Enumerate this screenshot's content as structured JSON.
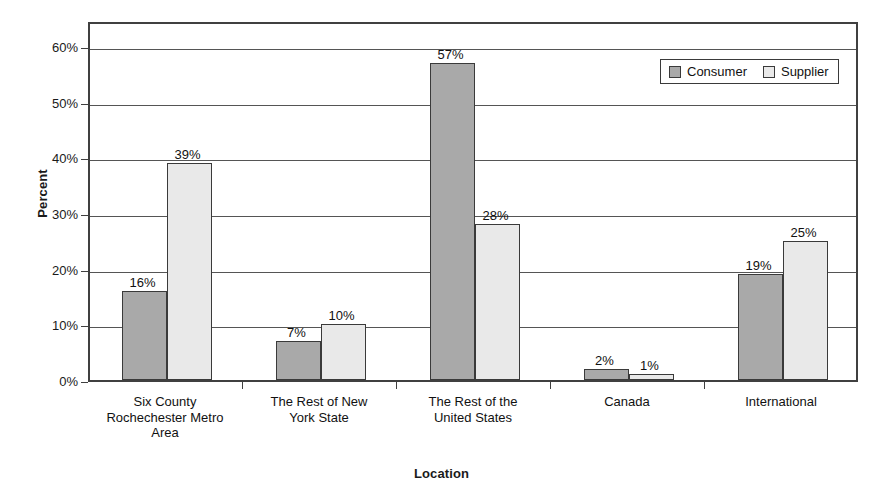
{
  "chart_data": {
    "type": "bar",
    "title": "",
    "xlabel": "Location",
    "ylabel": "Percent",
    "categories": [
      "Six County\nRochechester Metro\nArea",
      "The Rest of New\nYork State",
      "The Rest of the\nUnited States",
      "Canada",
      "International"
    ],
    "series": [
      {
        "name": "Consumer",
        "values": [
          16,
          7,
          57,
          2,
          19
        ],
        "color": "#a9a9a9"
      },
      {
        "name": "Supplier",
        "values": [
          39,
          10,
          28,
          1,
          25
        ],
        "color": "#e9e9e9"
      }
    ],
    "value_labels": [
      [
        "16%",
        "39%"
      ],
      [
        "7%",
        "10%"
      ],
      [
        "57%",
        "28%"
      ],
      [
        "2%",
        "1%"
      ],
      [
        "19%",
        "25%"
      ]
    ],
    "ylim": [
      0,
      65
    ],
    "ytick_values": [
      0,
      10,
      20,
      30,
      40,
      50,
      60
    ],
    "ytick_labels": [
      "0%",
      "10%",
      "20%",
      "30%",
      "40%",
      "50%",
      "60%"
    ],
    "grid": true,
    "legend_position": "top-right",
    "legend_entries": [
      "Consumer",
      "Supplier"
    ]
  }
}
